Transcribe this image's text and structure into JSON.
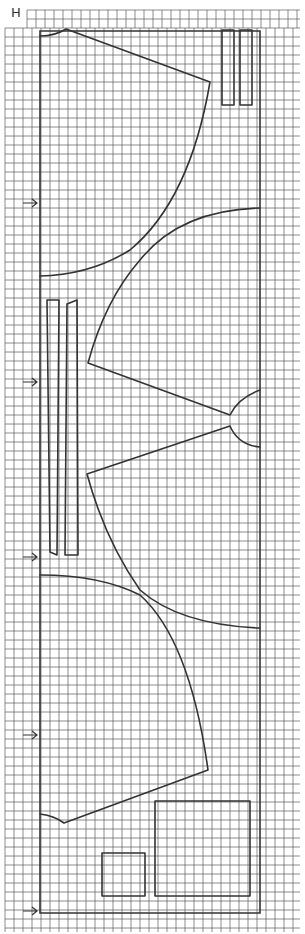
{
  "diagram": {
    "label": "H",
    "type": "sewing-pattern-layout",
    "grid": {
      "spacing_px": 9,
      "origin_x": 5,
      "origin_y": 10,
      "color": "#555555"
    },
    "line_color": "#333333",
    "grain_arrows": [
      {
        "x": 37,
        "y": 203
      },
      {
        "x": 37,
        "y": 382
      },
      {
        "x": 37,
        "y": 557
      },
      {
        "x": 37,
        "y": 735
      },
      {
        "x": 37,
        "y": 911
      }
    ],
    "pieces": [
      {
        "name": "upper-bodice-piece",
        "shape": "curved-wedge"
      },
      {
        "name": "upper-sleeve-piece",
        "shape": "curved-wedge"
      },
      {
        "name": "lower-sleeve-piece",
        "shape": "curved-wedge"
      },
      {
        "name": "lower-bodice-piece",
        "shape": "curved-wedge"
      },
      {
        "name": "strip-top-1",
        "shape": "rectangle"
      },
      {
        "name": "strip-top-2",
        "shape": "rectangle"
      },
      {
        "name": "strip-left-1",
        "shape": "rectangle"
      },
      {
        "name": "strip-left-2",
        "shape": "rectangle"
      },
      {
        "name": "small-square",
        "shape": "rectangle"
      },
      {
        "name": "large-square",
        "shape": "rectangle"
      }
    ]
  }
}
